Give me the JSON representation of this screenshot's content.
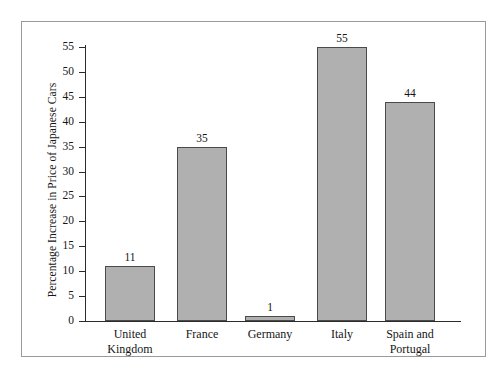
{
  "chart_data": {
    "type": "bar",
    "title": "",
    "subtitle": "",
    "xlabel": "",
    "ylabel": "Percentage Increase in Price of Japanese Cars",
    "categories": [
      "United Kingdom",
      "France",
      "Germany",
      "Italy",
      "Spain and Portugal"
    ],
    "category_lines": [
      [
        "United",
        "Kingdom"
      ],
      [
        "France",
        ""
      ],
      [
        "Germany",
        ""
      ],
      [
        "Italy",
        ""
      ],
      [
        "Spain and",
        "Portugal"
      ]
    ],
    "values": [
      11,
      35,
      1,
      55,
      44
    ],
    "value_labels": [
      "11",
      "35",
      "1",
      "55",
      "44"
    ],
    "ylim": [
      0,
      55
    ],
    "ytick_step": 5,
    "yticks": [
      0,
      5,
      10,
      15,
      20,
      25,
      30,
      35,
      40,
      45,
      50,
      55
    ],
    "ytick_labels": [
      "0",
      "5",
      "10",
      "15",
      "20",
      "25",
      "30",
      "35",
      "40",
      "45",
      "50",
      "55"
    ],
    "grid": false,
    "legend": null,
    "legend_position": "none",
    "bar_fill_color": "#b0b0b0",
    "bar_edge_color": "#4a4a4a",
    "axis_color": "#2b2b2b",
    "frame_color": "#9a9a9a",
    "background_color": "#ffffff"
  }
}
